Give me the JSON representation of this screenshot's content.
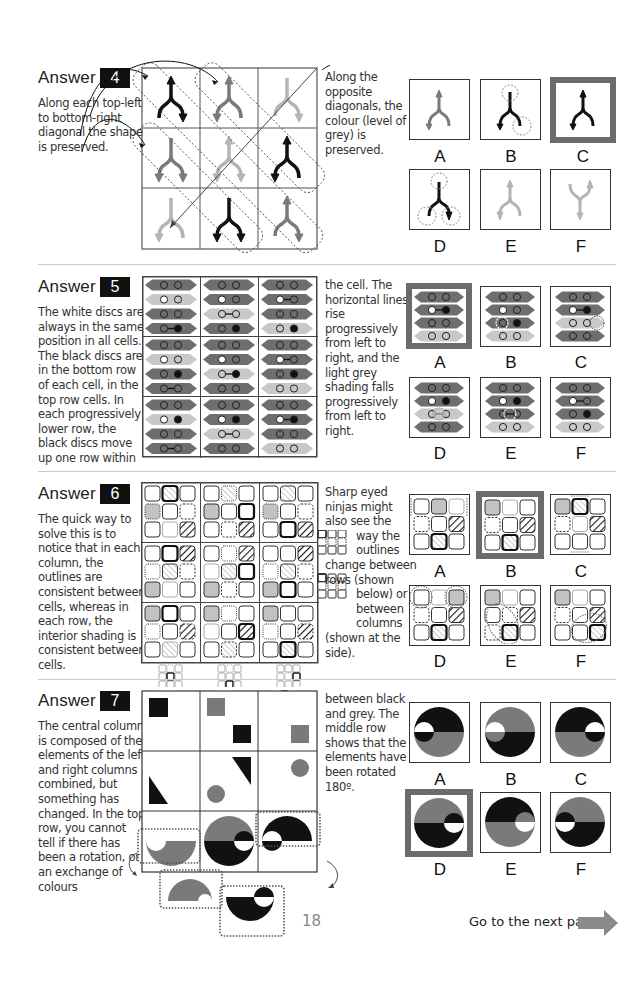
{
  "page": {
    "page_number": "18",
    "next_page_label": "Go to the next page",
    "next_arrow_color": "#8a8a8a"
  },
  "answers": [
    {
      "heading": "Answer",
      "number": "4",
      "explanation_left": [
        "Along each top-left",
        "to bottom-right",
        "diagonal the shape",
        "is preserved."
      ],
      "explanation_right": [
        "Along the",
        "opposite",
        "diagonals, the",
        "colour (level of",
        "grey) is",
        "preserved."
      ],
      "options": [
        "A",
        "B",
        "C",
        "D",
        "E",
        "F"
      ],
      "correct": "C"
    },
    {
      "heading": "Answer",
      "number": "5",
      "explanation_left": [
        "The white discs are",
        "always in the same",
        "position in all cells.",
        "The black discs are",
        "in the bottom row",
        "of each cell, in the",
        "top row cells. In",
        "each progressively",
        "lower row, the",
        "black discs move",
        "up one row within"
      ],
      "explanation_right": [
        "the cell. The",
        "horizontal lines",
        "rise",
        "progressively",
        "from left to",
        "right, and the",
        "light grey",
        "shading falls",
        "progressively",
        "from left to",
        "right."
      ],
      "options": [
        "A",
        "B",
        "C",
        "D",
        "E",
        "F"
      ],
      "correct": "A"
    },
    {
      "heading": "Answer",
      "number": "6",
      "explanation_left": [
        "The quick way to",
        "solve this is to",
        "notice that in each",
        "column, the",
        "outlines are",
        "consistent between",
        "cells, whereas in",
        "each row, the",
        "interior shading is",
        "consistent between",
        "cells."
      ],
      "explanation_right": [
        "Sharp eyed",
        "ninjas might",
        "also see the",
        "way the",
        "outlines",
        "change between",
        "rows (shown",
        "below) or",
        "between",
        "columns",
        "(shown at the",
        "side)."
      ],
      "options": [
        "A",
        "B",
        "C",
        "D",
        "E",
        "F"
      ],
      "correct": "B"
    },
    {
      "heading": "Answer",
      "number": "7",
      "explanation_left": [
        "The central column",
        "is composed of the",
        "elements of the left",
        "and right columns",
        "combined, but",
        "something has",
        "changed. In the top",
        "row, you cannot",
        "tell if there has",
        "been a rotation, or",
        "an exchange of",
        "colours"
      ],
      "explanation_right": [
        "between black",
        "and grey. The",
        "middle row",
        "shows that the",
        "elements have",
        "been rotated",
        "180º."
      ],
      "options": [
        "A",
        "B",
        "C",
        "D",
        "E",
        "F"
      ],
      "correct": "D"
    }
  ],
  "colors": {
    "black": "#111111",
    "mid_grey": "#7a7a7a",
    "light_grey": "#b4b4b4",
    "selected_border": "#6b6b6b"
  }
}
